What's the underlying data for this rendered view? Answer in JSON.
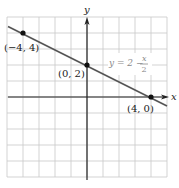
{
  "chart_data": {
    "type": "line",
    "title": "",
    "xlabel": "x",
    "ylabel": "y",
    "xlim": [
      -5,
      5
    ],
    "ylim": [
      -5,
      5
    ],
    "grid": true,
    "grid_step": 1,
    "series": [
      {
        "name": "y = 2 - x/2",
        "equation": "y = 2 − x/2",
        "slope": -0.5,
        "intercept": 2,
        "points": [
          {
            "x": -4,
            "y": 4,
            "label": "(−4, 4)"
          },
          {
            "x": 0,
            "y": 2,
            "label": "(0, 2)"
          },
          {
            "x": 4,
            "y": 0,
            "label": "(4, 0)"
          }
        ]
      }
    ],
    "annotations": [
      {
        "text": "y = 2 − x/2",
        "near": {
          "x": 2.2,
          "y": 1.7
        }
      }
    ]
  },
  "labels": {
    "x_axis": "x",
    "y_axis": "y",
    "eq_lhs": "y = 2 −",
    "eq_num": "x",
    "eq_den": "2",
    "p1": "(−4, 4)",
    "p2": "(0, 2)",
    "p3": "(4, 0)"
  },
  "colors": {
    "grid": "#c8c8c8",
    "axis": "#222222",
    "line": "#555555",
    "point": "#111111",
    "label": "#222222",
    "equation": "#8a8a8a"
  }
}
